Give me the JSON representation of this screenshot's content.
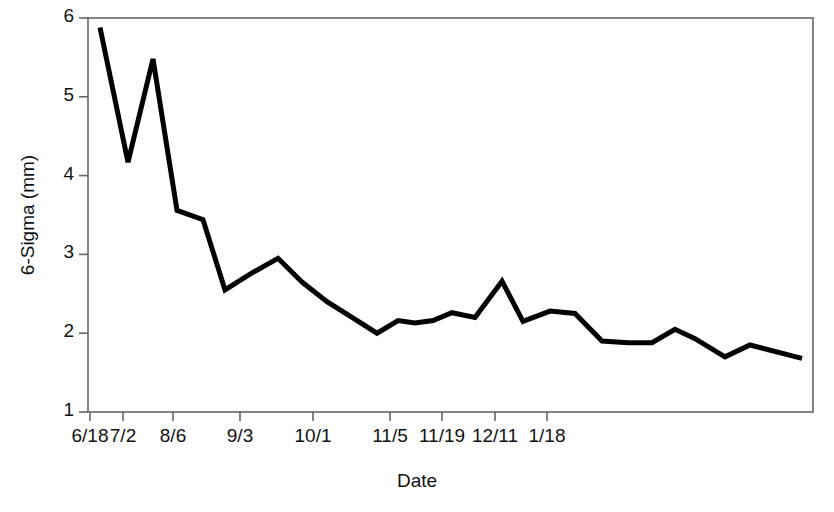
{
  "chart_data": {
    "type": "line",
    "title": "",
    "xlabel": "Date",
    "ylabel": "6-Sigma (mm)",
    "ylim": [
      1,
      6
    ],
    "yticks": [
      1,
      2,
      3,
      4,
      5,
      6
    ],
    "ytick_labels": [
      "1",
      "2",
      "3",
      "4",
      "5",
      "6"
    ],
    "xtick_labels": [
      "6/18",
      "7/2",
      "8/6",
      "9/3",
      "10/1",
      "11/5",
      "11/19",
      "12/11",
      "1/18"
    ],
    "xtick_positions_px": [
      90,
      123,
      173,
      240,
      313,
      390,
      442,
      495,
      547
    ],
    "grid": false,
    "legend": "none",
    "line_color": "#000000",
    "line_width_px": 5,
    "series": [
      {
        "name": "6-Sigma",
        "x_index": [
          0,
          1,
          2,
          3,
          4,
          5,
          6,
          7,
          8,
          9,
          10,
          11,
          12,
          13,
          14,
          15,
          16,
          17,
          18,
          19,
          20,
          21,
          22,
          23,
          24,
          25,
          26,
          27,
          28
        ],
        "x_px": [
          100,
          128,
          153,
          177,
          203,
          225,
          250,
          278,
          302,
          327,
          352,
          377,
          398,
          415,
          433,
          452,
          475,
          502,
          523,
          550,
          575,
          602,
          628,
          652,
          675,
          695,
          725,
          750,
          802
        ],
        "values": [
          5.88,
          4.17,
          5.48,
          3.56,
          3.44,
          2.55,
          2.75,
          2.95,
          2.65,
          2.4,
          2.2,
          2.0,
          2.16,
          2.13,
          2.16,
          2.26,
          2.2,
          2.66,
          2.15,
          2.28,
          2.25,
          1.9,
          1.88,
          1.88,
          2.05,
          1.93,
          1.7,
          1.85,
          1.68
        ]
      }
    ],
    "frame": {
      "left_px": 88,
      "right_px": 813,
      "top_px": 18,
      "bottom_px": 412,
      "border_color": "#555555"
    }
  },
  "axes": {
    "y_title": "6-Sigma (mm)",
    "x_title": "Date"
  }
}
